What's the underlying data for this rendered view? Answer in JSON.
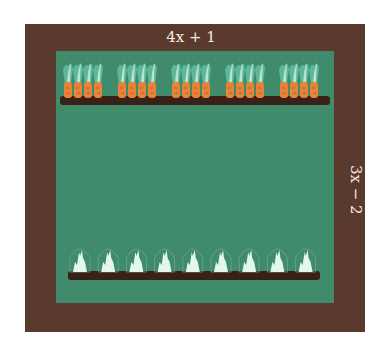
{
  "diagram": {
    "width_label": "4x + 1",
    "height_label": "3x − 2",
    "colors": {
      "border": "#5a3a2c",
      "garden": "#3f8b6c",
      "soil": "#3a2118",
      "carrot": "#e8833a",
      "leaf": "#b9e6d2",
      "sprout": "#e4f7ef"
    },
    "top_row": {
      "type": "carrots",
      "groups": 5,
      "per_group": 4
    },
    "bottom_row": {
      "type": "covered seedlings",
      "count": 9
    }
  }
}
